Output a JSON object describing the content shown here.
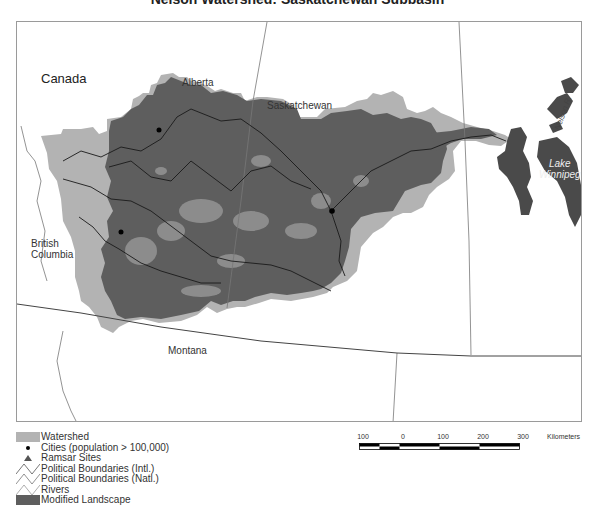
{
  "title": "Nelson Watershed: Saskatchewan Subbasin",
  "colors": {
    "watershed": "#b3b3b3",
    "modified_landscape": "#5e5e5e",
    "lake": "#4a4a4a",
    "boundary_line": "#666666",
    "intl_boundary": "#444444",
    "river": "#1a1a1a",
    "frame": "#9a9a9a"
  },
  "map": {
    "labels": {
      "country": "Canada",
      "alberta": "Alberta",
      "saskatchewan": "Saskatchewan",
      "british_columbia_line1": "British",
      "british_columbia_line2": "Columbia",
      "montana": "Montana",
      "lake_line1": "Lake",
      "lake_line2": "Winnipeg",
      "nelson_river": "Nelson R."
    }
  },
  "legend": {
    "items": [
      {
        "label": "Watershed",
        "symbol": "gray-fill"
      },
      {
        "label": "Cities (population > 100,000)",
        "symbol": "dot"
      },
      {
        "label": "Ramsar Sites",
        "symbol": "triangle"
      },
      {
        "label": "Political Boundaries (Intl.)",
        "symbol": "line"
      },
      {
        "label": "Political Boundaries (Natl.)",
        "symbol": "line"
      },
      {
        "label": "Rivers",
        "symbol": "line"
      },
      {
        "label": "Modified Landscape",
        "symbol": "dark-fill"
      }
    ]
  },
  "scalebar": {
    "ticks": [
      "100",
      "0",
      "100",
      "200",
      "300"
    ],
    "unit": "Kilometers"
  }
}
